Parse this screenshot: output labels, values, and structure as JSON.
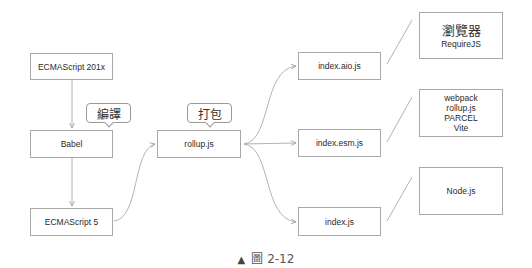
{
  "diagram": {
    "nodes": {
      "es201x": {
        "label": "ECMAScript 201x"
      },
      "babel": {
        "label": "Babel"
      },
      "es5": {
        "label": "ECMAScript 5"
      },
      "rollup": {
        "label": "rollup.js"
      },
      "aio": {
        "label": "index.aio.js"
      },
      "esm": {
        "label": "index.esm.js"
      },
      "cjs": {
        "label": "index.js"
      }
    },
    "callouts": {
      "compile": {
        "label": "編譯"
      },
      "bundle": {
        "label": "打包"
      }
    },
    "targets": {
      "browser": {
        "title": "瀏覽器",
        "subtitle": "RequireJS"
      },
      "bundlers": {
        "lines": [
          "webpack",
          "rollup.js",
          "PARCEL",
          "Vite"
        ]
      },
      "node": {
        "label": "Node.js"
      }
    },
    "edges": [
      {
        "from": "ECMAScript 201x",
        "to": "Babel"
      },
      {
        "from": "Babel",
        "to": "ECMAScript 5"
      },
      {
        "from": "ECMAScript 5",
        "to": "rollup.js"
      },
      {
        "from": "rollup.js",
        "to": "index.aio.js"
      },
      {
        "from": "rollup.js",
        "to": "index.esm.js"
      },
      {
        "from": "rollup.js",
        "to": "index.js"
      }
    ],
    "associations": [
      {
        "from": "index.aio.js",
        "to": "瀏覽器 RequireJS"
      },
      {
        "from": "index.esm.js",
        "to": "webpack / rollup.js / PARCEL / Vite"
      },
      {
        "from": "index.js",
        "to": "Node.js"
      }
    ],
    "colors": {
      "line": "#a0a0a0",
      "border": "#a8a8a8",
      "text": "#2a2a2a"
    }
  },
  "caption": {
    "marker": "▲",
    "text": "圖 2-12"
  }
}
